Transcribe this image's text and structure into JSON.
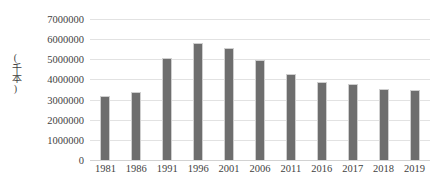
{
  "chart_data": {
    "type": "bar",
    "title": "",
    "subtitle": "",
    "xlabel": "",
    "ylabel": "(千本)",
    "categories": [
      "1981",
      "1986",
      "1991",
      "1996",
      "2001",
      "2006",
      "2011",
      "2016",
      "2017",
      "2018",
      "2019"
    ],
    "values": [
      3180000,
      3380000,
      5080000,
      5820000,
      5570000,
      4980000,
      4280000,
      3850000,
      3750000,
      3530000,
      3480000
    ],
    "ylim": [
      0,
      7000000
    ],
    "ytick_values": [
      0,
      1000000,
      2000000,
      3000000,
      4000000,
      5000000,
      6000000,
      7000000
    ],
    "ytick_labels": [
      "0",
      "1000000",
      "2000000",
      "3000000",
      "4000000",
      "5000000",
      "6000000",
      "7000000"
    ],
    "grid": "horizontal",
    "legend": "none",
    "colors": {
      "bar_fill": "#6e6e6e",
      "bar_border": "#cfcfcf",
      "gridline": "#e2e2e2",
      "baseline": "#d2d2d2",
      "text": "#3f3f3f",
      "background": "#ffffff"
    }
  }
}
